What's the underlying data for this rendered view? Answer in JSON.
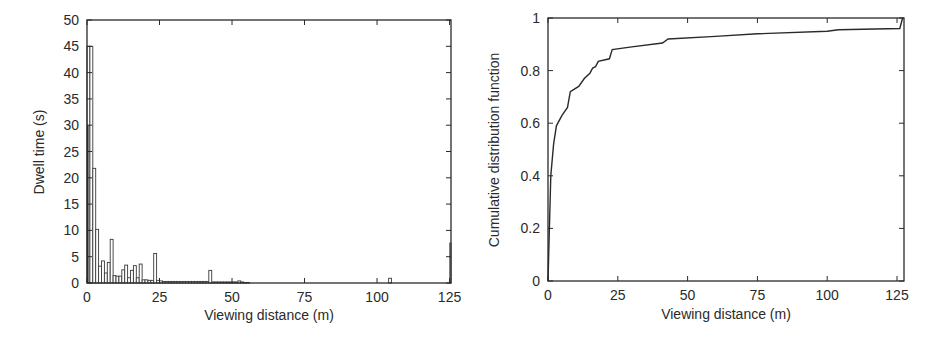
{
  "chart_data": [
    {
      "type": "bar",
      "title": "",
      "xlabel": "Viewing distance (m)",
      "ylabel": "Dwell time (s)",
      "xlim": [
        0,
        127
      ],
      "ylim": [
        0,
        50
      ],
      "xticks": [
        0,
        25,
        50,
        75,
        100,
        125
      ],
      "yticks": [
        0,
        5,
        10,
        15,
        20,
        25,
        30,
        35,
        40,
        45,
        50
      ],
      "grid": false,
      "legend": null,
      "bin_width": 1,
      "x": [
        0,
        1,
        2,
        3,
        4,
        5,
        6,
        7,
        8,
        9,
        10,
        11,
        12,
        13,
        14,
        15,
        16,
        17,
        18,
        19,
        20,
        21,
        22,
        23,
        24,
        25,
        26,
        27,
        28,
        29,
        30,
        31,
        32,
        33,
        34,
        35,
        36,
        37,
        38,
        39,
        40,
        41,
        42,
        43,
        44,
        45,
        46,
        47,
        48,
        49,
        50,
        51,
        52,
        53,
        54,
        55,
        104,
        127
      ],
      "values": [
        45,
        45,
        21.8,
        10.2,
        3.2,
        4.2,
        1.9,
        3.9,
        8.3,
        1.4,
        1.3,
        1.3,
        2.5,
        3.4,
        1,
        2.4,
        3.3,
        1,
        3.6,
        0.6,
        0.6,
        0.5,
        0.5,
        5.6,
        0.5,
        0.4,
        0.3,
        0.3,
        0.3,
        0.3,
        0.3,
        0.3,
        0.3,
        0.3,
        0.3,
        0.3,
        0.3,
        0.3,
        0.3,
        0.3,
        0.3,
        0.3,
        2.4,
        0.2,
        0.2,
        0.2,
        0.2,
        0.2,
        0.2,
        0.2,
        0.2,
        0.2,
        0.4,
        0.2,
        0.1,
        0.1,
        0.9,
        7.6
      ],
      "overlay_bar": {
        "x": 0,
        "value": 30
      }
    },
    {
      "type": "line",
      "title": "",
      "xlabel": "Viewing distance (m)",
      "ylabel": "Cumulative distribution function",
      "xlim": [
        0,
        127
      ],
      "ylim": [
        0,
        1
      ],
      "xticks": [
        0,
        25,
        50,
        75,
        100,
        125
      ],
      "yticks": [
        0,
        0.2,
        0.4,
        0.6,
        0.8,
        1
      ],
      "grid": false,
      "legend": null,
      "series": [
        {
          "name": "CDF",
          "x": [
            0,
            1,
            2,
            3,
            5,
            7,
            8,
            11,
            13,
            15,
            16,
            17,
            18,
            22,
            23,
            30,
            41,
            43,
            60,
            75,
            100,
            104,
            126,
            127
          ],
          "values": [
            0,
            0.4,
            0.52,
            0.59,
            0.63,
            0.66,
            0.72,
            0.74,
            0.77,
            0.79,
            0.81,
            0.815,
            0.835,
            0.845,
            0.88,
            0.89,
            0.905,
            0.92,
            0.93,
            0.94,
            0.95,
            0.955,
            0.96,
            1.0
          ]
        }
      ]
    }
  ],
  "left_chart": {
    "xlabel": "Viewing distance (m)",
    "ylabel": "Dwell time (s)",
    "xtick_labels": [
      "0",
      "25",
      "50",
      "75",
      "100",
      "125"
    ],
    "ytick_labels": [
      "0",
      "5",
      "10",
      "15",
      "20",
      "25",
      "30",
      "35",
      "40",
      "45",
      "50"
    ]
  },
  "right_chart": {
    "xlabel": "Viewing distance (m)",
    "ylabel": "Cumulative distribution function",
    "xtick_labels": [
      "0",
      "25",
      "50",
      "75",
      "100",
      "125"
    ],
    "ytick_labels": [
      "0",
      "0.2",
      "0.4",
      "0.6",
      "0.8",
      "1"
    ]
  },
  "colors": {
    "axis": "#2a2a2a",
    "bar_stroke": "#3a3a3a",
    "bar_fill": "#ffffff",
    "line": "#2a2a2a"
  }
}
